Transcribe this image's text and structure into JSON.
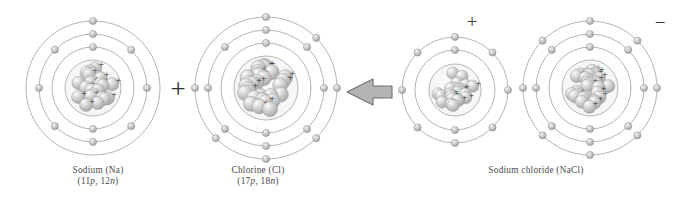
{
  "figure": {
    "type": "diagram",
    "background_color": "#ffffff",
    "line_color": "#9a9a9a",
    "text_color": "#4a4a4a",
    "sphere_color": "#c9c9c9",
    "arrow_fill": "#b0b0b0",
    "arrow_stroke": "#6e6e6e"
  },
  "operators": {
    "plus": "+",
    "arrow": "reaction-arrow"
  },
  "reactants": [
    {
      "id": "sodium-atom",
      "name": "Sodium (Na)",
      "nucleus": "(11p, 12n)",
      "nucleus_protons": "11p",
      "nucleus_neutrons": "12n",
      "protons": 11,
      "neutrons": 12,
      "shell_counts": [
        2,
        8,
        1
      ],
      "shell_radii": [
        28,
        41,
        54,
        67
      ],
      "center_x": 93,
      "center_y": 88,
      "nucleus_radius": 28,
      "charge": ""
    },
    {
      "id": "chlorine-atom",
      "name": "Chlorine (Cl)",
      "nucleus": "(17p, 18n)",
      "nucleus_protons": "17p",
      "nucleus_neutrons": "18n",
      "protons": 17,
      "neutrons": 18,
      "shell_counts": [
        2,
        8,
        7
      ],
      "shell_radii": [
        32,
        45,
        58,
        71
      ],
      "center_x": 266,
      "center_y": 88,
      "nucleus_radius": 32,
      "charge": ""
    }
  ],
  "products": [
    {
      "id": "sodium-ion",
      "name": "sodium ion",
      "shell_counts": [
        2,
        8
      ],
      "shell_radii": [
        26,
        40,
        53
      ],
      "center_x": 455,
      "center_y": 90,
      "nucleus_radius": 26,
      "charge": "+"
    },
    {
      "id": "chloride-ion",
      "name": "chloride ion",
      "shell_counts": [
        2,
        8,
        8
      ],
      "shell_radii": [
        28,
        41,
        54,
        67
      ],
      "center_x": 590,
      "center_y": 88,
      "nucleus_radius": 28,
      "charge": "−"
    }
  ],
  "product_label": {
    "name": "Sodium chloride (NaCl)"
  },
  "captions": {
    "sodium": {
      "line1": "Sodium (Na)",
      "paren_open": "(",
      "p_value": "11",
      "p_unit": "p",
      "comma": ", ",
      "n_value": "12",
      "n_unit": "n",
      "paren_close": ")"
    },
    "chlorine": {
      "line1": "Chlorine (Cl)",
      "paren_open": "(",
      "p_value": "17",
      "p_unit": "p",
      "comma": ", ",
      "n_value": "18",
      "n_unit": "n",
      "paren_close": ")"
    },
    "product": {
      "line1": "Sodium chloride (NaCl)"
    }
  }
}
